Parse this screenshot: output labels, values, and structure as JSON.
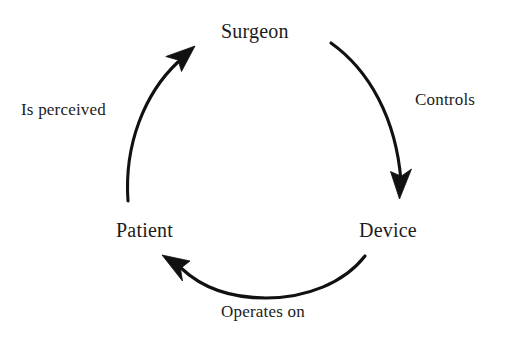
{
  "diagram": {
    "type": "cycle",
    "background_color": "#ffffff",
    "stroke_color": "#111111",
    "text_color": "#1c1c1c",
    "nodes": [
      {
        "id": "surgeon",
        "label": "Surgeon",
        "position": "top"
      },
      {
        "id": "device",
        "label": "Device",
        "position": "bottom-right"
      },
      {
        "id": "patient",
        "label": "Patient",
        "position": "bottom-left"
      }
    ],
    "edges": [
      {
        "id": "controls",
        "label": "Controls",
        "from": "surgeon",
        "to": "device",
        "direction": "clockwise",
        "label_position": "right"
      },
      {
        "id": "operates-on",
        "label": "Operates on",
        "from": "device",
        "to": "patient",
        "direction": "clockwise",
        "label_position": "bottom"
      },
      {
        "id": "is-perceived",
        "label": "Is perceived",
        "from": "patient",
        "to": "surgeon",
        "direction": "clockwise",
        "label_position": "left"
      }
    ]
  }
}
